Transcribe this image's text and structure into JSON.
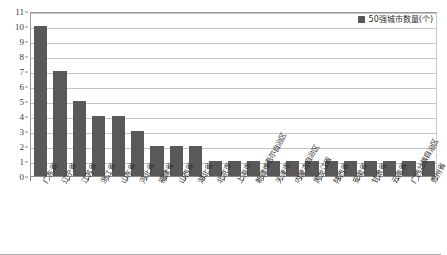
{
  "chart_data": {
    "type": "bar",
    "title": "",
    "xlabel": "",
    "ylabel": "",
    "ylim": [
      0,
      11
    ],
    "ytick_labels": [
      "0",
      "1",
      "2",
      "3",
      "4",
      "5",
      "6",
      "7",
      "8",
      "9",
      "10",
      "11"
    ],
    "grid": true,
    "legend_position": "top-right",
    "legend_entries": [
      "50强城市数量(个)"
    ],
    "series_name": "50强城市数量(个)",
    "bar_color": "#595959",
    "categories": [
      "广东省",
      "辽宁省",
      "江苏省",
      "浙江省",
      "山东省",
      "河北省",
      "福建省",
      "山西省",
      "湖北省",
      "北京市",
      "上海市",
      "新疆维吾尔自治区",
      "天津市",
      "内蒙古自治区",
      "黑龙江省",
      "陕西省",
      "安徽省",
      "甘肃省",
      "云南省",
      "广西壮族自治区",
      "贵州省"
    ],
    "values": [
      10,
      7,
      5,
      4,
      4,
      3,
      2,
      2,
      2,
      1,
      1,
      1,
      1,
      1,
      1,
      1,
      1,
      1,
      1,
      1,
      1
    ]
  }
}
